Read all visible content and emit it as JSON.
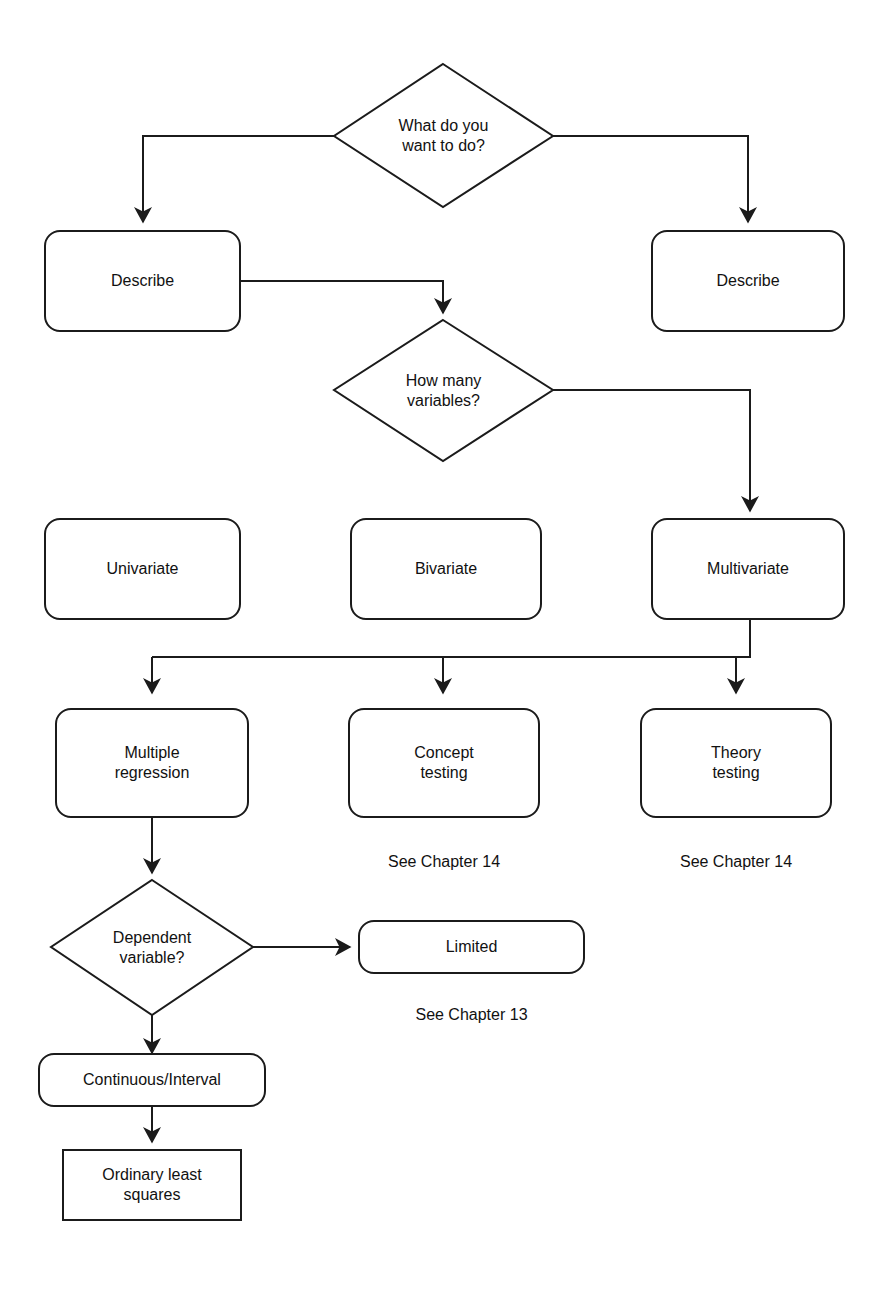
{
  "diagram": {
    "background_color": "#ffffff",
    "line_color": "#1b1b1b",
    "text_color": "#111111",
    "nodes": [
      {
        "id": "what-do-you-want-to-do",
        "shape": "diamond",
        "label": "What do you\nwant to do?"
      },
      {
        "id": "describe-left",
        "shape": "rounded-rect",
        "label": "Describe"
      },
      {
        "id": "describe-right",
        "shape": "rounded-rect",
        "label": "Describe"
      },
      {
        "id": "how-many-variables",
        "shape": "diamond",
        "label": "How many\nvariables?"
      },
      {
        "id": "univariate",
        "shape": "rounded-rect",
        "label": "Univariate"
      },
      {
        "id": "bivariate",
        "shape": "rounded-rect",
        "label": "Bivariate"
      },
      {
        "id": "multivariate",
        "shape": "rounded-rect",
        "label": "Multivariate"
      },
      {
        "id": "multiple-regression",
        "shape": "rounded-rect",
        "label": "Multiple\nregression"
      },
      {
        "id": "concept-testing",
        "shape": "rounded-rect",
        "label": "Concept\ntesting"
      },
      {
        "id": "theory-testing",
        "shape": "rounded-rect",
        "label": "Theory\ntesting"
      },
      {
        "id": "dependent-variable",
        "shape": "diamond",
        "label": "Dependent\nvariable?"
      },
      {
        "id": "limited",
        "shape": "rounded-rect",
        "label": "Limited"
      },
      {
        "id": "continuous-interval",
        "shape": "rounded-rect",
        "label": "Continuous/Interval"
      },
      {
        "id": "ordinary-least-squares",
        "shape": "rect",
        "label": "Ordinary least\nsquares"
      }
    ],
    "captions": [
      {
        "id": "caption-concept-testing",
        "label": "See Chapter 14"
      },
      {
        "id": "caption-theory-testing",
        "label": "See Chapter 14"
      },
      {
        "id": "caption-limited",
        "label": "See Chapter 13"
      }
    ]
  }
}
